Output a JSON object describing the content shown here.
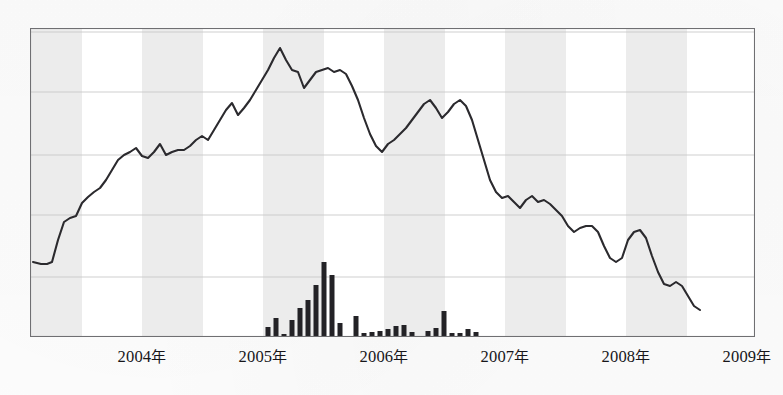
{
  "chart_data": {
    "type": "line",
    "title": "",
    "subtitle": "",
    "xlabel": "",
    "ylabel": "",
    "grid": true,
    "legend": false,
    "axis": {
      "x_tick_labels": [
        "2004年",
        "2005年",
        "2006年",
        "2007年",
        "2008年",
        "2009年"
      ],
      "x_tick_positions_px": [
        142,
        263,
        384,
        505,
        626,
        747
      ],
      "y_gridline_positions_px": [
        32,
        92,
        155,
        215,
        277
      ],
      "baseline_px": 337,
      "plot_left_px": 30,
      "plot_right_px": 755,
      "plot_top_px": 28,
      "plot_bottom_px": 337
    },
    "shaded_bands": [
      {
        "x0": 30,
        "x1": 82
      },
      {
        "x0": 142,
        "x1": 203
      },
      {
        "x0": 263,
        "x1": 324
      },
      {
        "x0": 384,
        "x1": 445
      },
      {
        "x0": 505,
        "x1": 566
      },
      {
        "x0": 626,
        "x1": 687
      }
    ],
    "series": [
      {
        "name": "index-line",
        "type": "line",
        "color": "#2b2a2e",
        "points_px": [
          [
            33,
            262
          ],
          [
            41,
            264
          ],
          [
            47,
            264
          ],
          [
            52,
            262
          ],
          [
            58,
            240
          ],
          [
            64,
            222
          ],
          [
            70,
            218
          ],
          [
            76,
            216
          ],
          [
            82,
            203
          ],
          [
            88,
            197
          ],
          [
            94,
            192
          ],
          [
            100,
            188
          ],
          [
            106,
            180
          ],
          [
            112,
            170
          ],
          [
            118,
            160
          ],
          [
            124,
            155
          ],
          [
            130,
            152
          ],
          [
            136,
            148
          ],
          [
            142,
            156
          ],
          [
            148,
            158
          ],
          [
            154,
            152
          ],
          [
            160,
            144
          ],
          [
            166,
            155
          ],
          [
            172,
            152
          ],
          [
            178,
            150
          ],
          [
            184,
            150
          ],
          [
            190,
            146
          ],
          [
            196,
            140
          ],
          [
            202,
            136
          ],
          [
            208,
            140
          ],
          [
            214,
            130
          ],
          [
            220,
            120
          ],
          [
            226,
            110
          ],
          [
            232,
            103
          ],
          [
            238,
            115
          ],
          [
            244,
            108
          ],
          [
            250,
            100
          ],
          [
            256,
            90
          ],
          [
            262,
            80
          ],
          [
            268,
            70
          ],
          [
            274,
            58
          ],
          [
            280,
            48
          ],
          [
            286,
            60
          ],
          [
            292,
            70
          ],
          [
            298,
            72
          ],
          [
            304,
            88
          ],
          [
            310,
            80
          ],
          [
            316,
            72
          ],
          [
            322,
            70
          ],
          [
            328,
            68
          ],
          [
            334,
            72
          ],
          [
            340,
            70
          ],
          [
            346,
            74
          ],
          [
            352,
            86
          ],
          [
            358,
            100
          ],
          [
            364,
            118
          ],
          [
            370,
            134
          ],
          [
            376,
            146
          ],
          [
            382,
            152
          ],
          [
            388,
            144
          ],
          [
            394,
            140
          ],
          [
            400,
            134
          ],
          [
            406,
            128
          ],
          [
            412,
            120
          ],
          [
            418,
            112
          ],
          [
            424,
            104
          ],
          [
            430,
            100
          ],
          [
            436,
            108
          ],
          [
            442,
            118
          ],
          [
            448,
            112
          ],
          [
            454,
            104
          ],
          [
            460,
            100
          ],
          [
            466,
            106
          ],
          [
            472,
            120
          ],
          [
            478,
            140
          ],
          [
            484,
            160
          ],
          [
            490,
            180
          ],
          [
            496,
            192
          ],
          [
            502,
            198
          ],
          [
            508,
            196
          ],
          [
            514,
            202
          ],
          [
            520,
            208
          ],
          [
            526,
            200
          ],
          [
            532,
            196
          ],
          [
            538,
            202
          ],
          [
            544,
            200
          ],
          [
            550,
            204
          ],
          [
            556,
            210
          ],
          [
            562,
            216
          ],
          [
            568,
            226
          ],
          [
            574,
            232
          ],
          [
            580,
            228
          ],
          [
            586,
            226
          ],
          [
            592,
            226
          ],
          [
            598,
            232
          ],
          [
            604,
            246
          ],
          [
            610,
            258
          ],
          [
            616,
            262
          ],
          [
            622,
            258
          ],
          [
            628,
            240
          ],
          [
            634,
            232
          ],
          [
            640,
            230
          ],
          [
            646,
            238
          ],
          [
            652,
            256
          ],
          [
            658,
            272
          ],
          [
            664,
            284
          ],
          [
            670,
            286
          ],
          [
            676,
            282
          ],
          [
            682,
            286
          ],
          [
            688,
            296
          ],
          [
            694,
            306
          ],
          [
            700,
            310
          ]
        ]
      },
      {
        "name": "volume-bars",
        "type": "bar",
        "color": "#232226",
        "bar_width_px": 5,
        "bars_px": [
          [
            268,
            327
          ],
          [
            276,
            318
          ],
          [
            284,
            334
          ],
          [
            292,
            320
          ],
          [
            300,
            308
          ],
          [
            308,
            300
          ],
          [
            316,
            285
          ],
          [
            324,
            262
          ],
          [
            332,
            275
          ],
          [
            340,
            323
          ],
          [
            356,
            316
          ],
          [
            364,
            333
          ],
          [
            372,
            332
          ],
          [
            380,
            331
          ],
          [
            388,
            329
          ],
          [
            396,
            326
          ],
          [
            404,
            325
          ],
          [
            412,
            332
          ],
          [
            428,
            331
          ],
          [
            436,
            328
          ],
          [
            444,
            311
          ],
          [
            452,
            333
          ],
          [
            460,
            333
          ],
          [
            468,
            329
          ],
          [
            476,
            332
          ]
        ]
      }
    ]
  },
  "labels": {
    "x_ticks": [
      {
        "year": "2004",
        "suffix": "年",
        "x": 142
      },
      {
        "year": "2005",
        "suffix": "年",
        "x": 263
      },
      {
        "year": "2006",
        "suffix": "年",
        "x": 384
      },
      {
        "year": "2007",
        "suffix": "年",
        "x": 505
      },
      {
        "year": "2008",
        "suffix": "年",
        "x": 626
      },
      {
        "year": "2009",
        "suffix": "年",
        "x": 747
      }
    ]
  },
  "colors": {
    "line": "#2b2a2e",
    "bar": "#232226",
    "band": "#ececec",
    "grid": "#c9c9c9",
    "frame": "#6f6f72",
    "background": "#ffffff",
    "text": "#17161a"
  }
}
